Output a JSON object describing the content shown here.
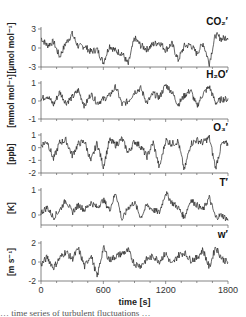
{
  "figure": {
    "xlabel": "time [s]",
    "x_ticks": [
      "0",
      "600",
      "1200",
      "1800"
    ],
    "caption_partial": "… time series of turbulent fluctuations …"
  },
  "chart_data": [
    {
      "type": "line",
      "title": "CO₂′",
      "xlabel": "time [s]",
      "ylabel": "[µmol mol⁻¹]",
      "xlim": [
        0,
        1800
      ],
      "ylim": [
        -3,
        3
      ],
      "y_ticks": [
        "3",
        "0",
        "-3"
      ],
      "grid": false,
      "x": [
        0,
        60,
        120,
        180,
        240,
        300,
        360,
        420,
        480,
        540,
        600,
        660,
        720,
        780,
        840,
        900,
        960,
        1020,
        1080,
        1140,
        1200,
        1260,
        1320,
        1380,
        1440,
        1500,
        1560,
        1620,
        1680,
        1740,
        1800
      ],
      "values": [
        1.6,
        0.4,
        1.0,
        -1.4,
        0.8,
        2.2,
        0.2,
        0.3,
        -0.6,
        -0.2,
        -2.3,
        0.4,
        -0.5,
        -0.8,
        -2.6,
        1.6,
        0.4,
        -0.2,
        0.6,
        0.9,
        -0.3,
        0.7,
        -1.9,
        0.3,
        0.5,
        -0.9,
        0.8,
        -2.4,
        2.1,
        1.4,
        1.8
      ]
    },
    {
      "type": "line",
      "title": "H₂O′",
      "xlabel": "time [s]",
      "ylabel": "[mmol mol⁻¹]",
      "xlim": [
        0,
        1800
      ],
      "ylim": [
        -1,
        1
      ],
      "y_ticks": [
        "1",
        "0",
        "-1"
      ],
      "grid": false,
      "x": [
        0,
        60,
        120,
        180,
        240,
        300,
        360,
        420,
        480,
        540,
        600,
        660,
        720,
        780,
        840,
        900,
        960,
        1020,
        1080,
        1140,
        1200,
        1260,
        1320,
        1380,
        1440,
        1500,
        1560,
        1620,
        1680,
        1740,
        1800
      ],
      "values": [
        0.1,
        0.3,
        -0.2,
        0.5,
        -0.1,
        0.2,
        0.6,
        -0.3,
        0.4,
        -0.1,
        0.1,
        0.3,
        0.8,
        -0.2,
        0.0,
        0.5,
        0.7,
        -0.1,
        0.4,
        0.2,
        0.9,
        0.5,
        -0.2,
        0.3,
        0.6,
        -0.3,
        0.4,
        0.8,
        -0.1,
        0.1,
        0.1
      ]
    },
    {
      "type": "line",
      "title": "O₃′",
      "xlabel": "time [s]",
      "ylabel": "[ppb]",
      "xlim": [
        0,
        1800
      ],
      "ylim": [
        -2,
        1
      ],
      "y_ticks": [
        "1",
        "0",
        "-1",
        "-2"
      ],
      "grid": false,
      "x": [
        0,
        60,
        120,
        180,
        240,
        300,
        360,
        420,
        480,
        540,
        600,
        660,
        720,
        780,
        840,
        900,
        960,
        1020,
        1080,
        1140,
        1200,
        1260,
        1320,
        1380,
        1440,
        1500,
        1560,
        1620,
        1680,
        1740,
        1800
      ],
      "values": [
        0.2,
        0.5,
        -0.9,
        0.4,
        0.6,
        -0.6,
        0.3,
        0.5,
        -1.1,
        0.4,
        -1.5,
        0.6,
        0.2,
        0.7,
        -0.4,
        0.5,
        0.1,
        -0.7,
        0.4,
        -1.6,
        0.6,
        0.3,
        0.5,
        -1.8,
        0.3,
        0.6,
        0.4,
        0.8,
        -1.6,
        0.3,
        0.3
      ]
    },
    {
      "type": "line",
      "title": "T′",
      "xlabel": "time [s]",
      "ylabel": "[K]",
      "xlim": [
        0,
        1800
      ],
      "ylim": [
        -0.4,
        1
      ],
      "y_ticks": [
        "1",
        "0"
      ],
      "grid": false,
      "x": [
        0,
        60,
        120,
        180,
        240,
        300,
        360,
        420,
        480,
        540,
        600,
        660,
        720,
        780,
        840,
        900,
        960,
        1020,
        1080,
        1140,
        1200,
        1260,
        1320,
        1380,
        1440,
        1500,
        1560,
        1620,
        1680,
        1740,
        1800
      ],
      "values": [
        0.1,
        0.3,
        -0.1,
        0.2,
        0.6,
        0.1,
        0.4,
        0.2,
        0.5,
        0.3,
        0.6,
        0.2,
        0.9,
        -0.2,
        0.3,
        0.5,
        -0.1,
        0.4,
        0.2,
        0.1,
        0.9,
        0.5,
        0.3,
        -0.1,
        0.6,
        0.4,
        0.2,
        0.7,
        -0.1,
        0.0,
        -0.2
      ]
    },
    {
      "type": "line",
      "title": "w′",
      "xlabel": "time [s]",
      "ylabel": "[m s⁻¹]",
      "xlim": [
        0,
        1800
      ],
      "ylim": [
        -2,
        2
      ],
      "y_ticks": [
        "2",
        "0",
        "-2"
      ],
      "grid": false,
      "x": [
        0,
        60,
        120,
        180,
        240,
        300,
        360,
        420,
        480,
        540,
        600,
        660,
        720,
        780,
        840,
        900,
        960,
        1020,
        1080,
        1140,
        1200,
        1260,
        1320,
        1380,
        1440,
        1500,
        1560,
        1620,
        1680,
        1740,
        1800
      ],
      "values": [
        -0.3,
        0.5,
        -0.6,
        0.4,
        1.1,
        0.3,
        1.4,
        -0.5,
        0.8,
        -1.6,
        1.5,
        0.2,
        0.6,
        0.9,
        1.2,
        -0.2,
        -0.4,
        0.3,
        0.6,
        0.1,
        0.9,
        -0.3,
        0.7,
        1.0,
        0.2,
        0.4,
        1.3,
        -0.6,
        1.6,
        0.4,
        -0.1
      ]
    }
  ]
}
